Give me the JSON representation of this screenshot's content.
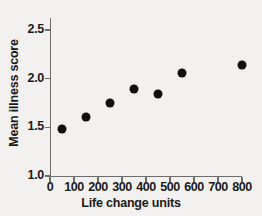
{
  "chart_data": {
    "type": "scatter",
    "title": "",
    "xlabel": "Life change units",
    "ylabel": "Mean illness score",
    "xlim": [
      0,
      800
    ],
    "ylim": [
      1.0,
      2.5
    ],
    "xticks": [
      0,
      100,
      200,
      300,
      400,
      500,
      600,
      700,
      800
    ],
    "xtick_labels": [
      "0",
      "100",
      "200",
      "300",
      "400",
      "500",
      "600",
      "700",
      "800"
    ],
    "yticks": [
      1.0,
      1.5,
      2.0,
      2.5
    ],
    "ytick_labels": [
      "1.0",
      "1.5",
      "2.0",
      "2.5"
    ],
    "grid": false,
    "legend": false,
    "marker": "filled-circle",
    "marker_color": "#101010",
    "axis_color": "#6e6e6e",
    "background_color": "#f2f1ef",
    "x": [
      50,
      150,
      250,
      350,
      450,
      550,
      800
    ],
    "y": [
      1.48,
      1.61,
      1.75,
      1.89,
      1.84,
      2.06,
      2.14
    ],
    "points": [
      {
        "x": 50,
        "y": 1.48
      },
      {
        "x": 150,
        "y": 1.61
      },
      {
        "x": 250,
        "y": 1.75
      },
      {
        "x": 350,
        "y": 1.89
      },
      {
        "x": 450,
        "y": 1.84
      },
      {
        "x": 550,
        "y": 2.06
      },
      {
        "x": 800,
        "y": 2.14
      }
    ]
  }
}
